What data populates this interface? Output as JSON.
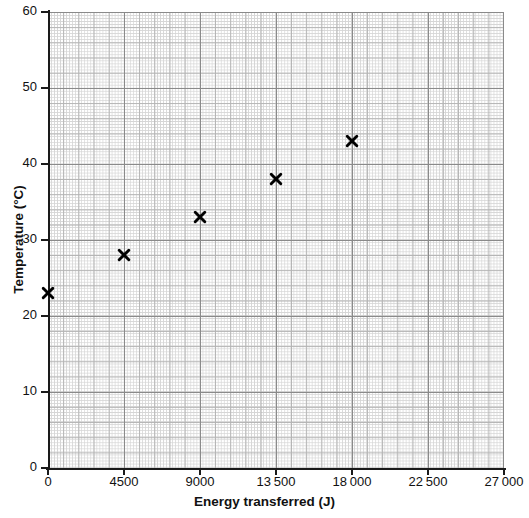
{
  "chart_data": {
    "type": "scatter",
    "title": "",
    "xlabel": "Energy transferred (J)",
    "ylabel": "Temperature (°C)",
    "xlim": [
      0,
      27000
    ],
    "ylim": [
      0,
      60
    ],
    "grid": "graph-paper",
    "legend": "none",
    "marker": "cross",
    "marker_color": "#000000",
    "x": [
      0,
      4500,
      9000,
      13500,
      18000
    ],
    "y": [
      23,
      28,
      33,
      38,
      43
    ],
    "points": [
      {
        "x": 0,
        "y": 23
      },
      {
        "x": 4500,
        "y": 28
      },
      {
        "x": 9000,
        "y": 33
      },
      {
        "x": 13500,
        "y": 38
      },
      {
        "x": 18000,
        "y": 43
      }
    ],
    "xticks": [
      0,
      4500,
      9000,
      13500,
      18000,
      22500,
      27000
    ],
    "xticklabels": [
      "0",
      "4500",
      "9000",
      "13 500",
      "18 000",
      "22 500",
      "27 000"
    ],
    "yticks": [
      0,
      10,
      20,
      30,
      40,
      50,
      60
    ],
    "yticklabels": [
      "0",
      "10",
      "20",
      "30",
      "40",
      "50",
      "60"
    ]
  },
  "colors": {
    "marker": "#000000",
    "axis": "#1a1a1a",
    "grid_major": "#8a8a8a",
    "grid_medium": "#b4b4b4",
    "grid_fine": "#d6d6d6",
    "background": "#ffffff"
  }
}
